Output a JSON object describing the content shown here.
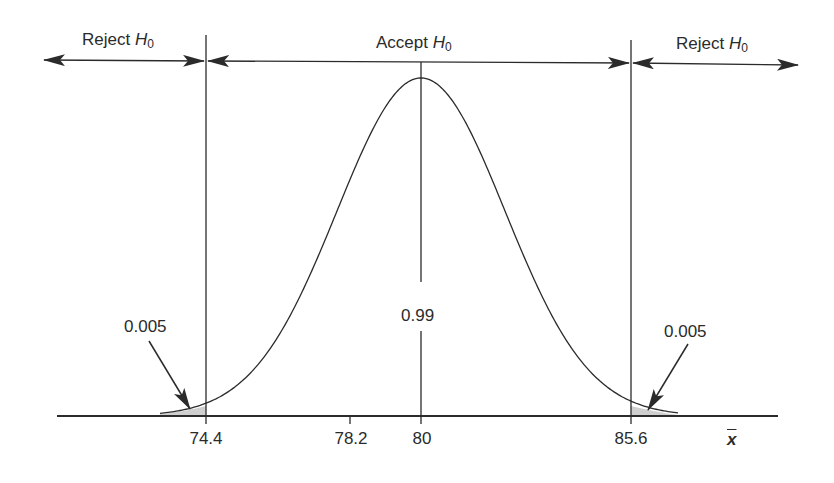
{
  "regions": {
    "left": {
      "label": "Reject",
      "symbol": "H",
      "subscript": "0"
    },
    "center": {
      "label": "Accept",
      "symbol": "H",
      "subscript": "0"
    },
    "right": {
      "label": "Reject",
      "symbol": "H",
      "subscript": "0"
    }
  },
  "annotations": {
    "left_tail": "0.005",
    "center_area": "0.99",
    "right_tail": "0.005"
  },
  "axis": {
    "label": "x",
    "ticks": [
      "74.4",
      "78.2",
      "80",
      "85.6"
    ]
  },
  "colors": {
    "line": "#2b2b2b",
    "shade": "#cfcfcf",
    "background": "#ffffff"
  },
  "chart_data": {
    "type": "area",
    "title": "",
    "xlabel": "x̄",
    "ylabel": "",
    "mean": 80,
    "critical_values": [
      74.4,
      85.6
    ],
    "marked_values": [
      74.4,
      78.2,
      80,
      85.6
    ],
    "areas": {
      "left_tail": 0.005,
      "center": 0.99,
      "right_tail": 0.005
    },
    "regions": [
      "Reject H0",
      "Accept H0",
      "Reject H0"
    ],
    "grid": false,
    "legend": "none"
  }
}
